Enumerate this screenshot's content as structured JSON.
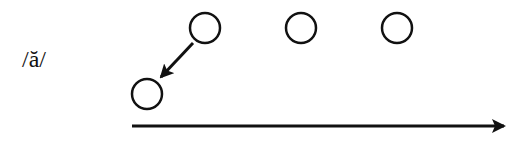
{
  "diagram": {
    "label": "/ă/",
    "color": "#111111",
    "circles": [
      {
        "id": "top-1",
        "cx": 205,
        "cy": 28,
        "r": 15
      },
      {
        "id": "top-2",
        "cx": 301,
        "cy": 28,
        "r": 15
      },
      {
        "id": "top-3",
        "cx": 397,
        "cy": 28,
        "r": 15
      },
      {
        "id": "bottom",
        "cx": 147,
        "cy": 94,
        "r": 15
      }
    ],
    "arrows": [
      {
        "id": "diagonal",
        "from": [
          193,
          43
        ],
        "to": [
          161,
          77
        ]
      },
      {
        "id": "timeline",
        "from": [
          132,
          126
        ],
        "to": [
          504,
          126
        ]
      }
    ]
  }
}
